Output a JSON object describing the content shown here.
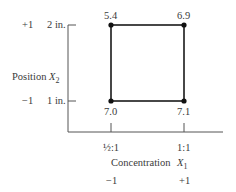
{
  "diagram": {
    "type": "factorial-design-square",
    "y_axis": {
      "label": "Position",
      "variable": "X",
      "subscript": "2",
      "ticks": [
        {
          "coded": "+1",
          "label": "2 in."
        },
        {
          "coded": "−1",
          "label": "1 in."
        }
      ]
    },
    "x_axis": {
      "label": "Concentration",
      "variable": "X",
      "subscript": "1",
      "ticks": [
        {
          "label": "½:1",
          "coded": "−1"
        },
        {
          "label": "1:1",
          "coded": "+1"
        }
      ]
    },
    "points": [
      {
        "position": "top-left",
        "value": "5.4"
      },
      {
        "position": "top-right",
        "value": "6.9"
      },
      {
        "position": "bottom-left",
        "value": "7.0"
      },
      {
        "position": "bottom-right",
        "value": "7.1"
      }
    ],
    "colors": {
      "axis": "#555555",
      "square": "#1a1a1a",
      "text": "#3a3a3a"
    }
  }
}
